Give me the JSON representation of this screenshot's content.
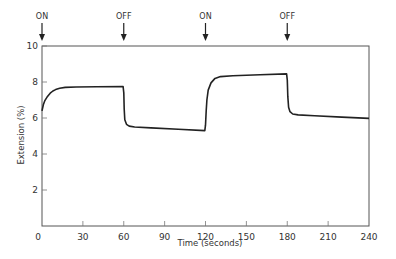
{
  "chart_data": {
    "type": "line",
    "title": "",
    "xlabel": "Time  (seconds)",
    "ylabel": "Extension  (%)",
    "xlim": [
      0,
      240
    ],
    "ylim": [
      0,
      10
    ],
    "x_ticks": [
      0,
      30,
      60,
      90,
      120,
      150,
      180,
      210,
      240
    ],
    "y_ticks": [
      2,
      4,
      6,
      8,
      10
    ],
    "y_tick_labels_shown": [
      "0",
      "2",
      "4",
      "6",
      "8",
      "10"
    ],
    "grid": false,
    "legend": null,
    "series": [
      {
        "name": "Extension",
        "color": "#222222",
        "points": [
          [
            0,
            6.4
          ],
          [
            1,
            6.75
          ],
          [
            2,
            6.95
          ],
          [
            4,
            7.2
          ],
          [
            6,
            7.38
          ],
          [
            8,
            7.5
          ],
          [
            10,
            7.58
          ],
          [
            13,
            7.65
          ],
          [
            17,
            7.7
          ],
          [
            25,
            7.72
          ],
          [
            40,
            7.74
          ],
          [
            59.5,
            7.75
          ],
          [
            60,
            7.4
          ],
          [
            60.3,
            6.5
          ],
          [
            60.8,
            5.9
          ],
          [
            62,
            5.65
          ],
          [
            64,
            5.55
          ],
          [
            68,
            5.5
          ],
          [
            80,
            5.45
          ],
          [
            100,
            5.38
          ],
          [
            119.5,
            5.3
          ],
          [
            120,
            5.6
          ],
          [
            120.5,
            6.4
          ],
          [
            121,
            7.0
          ],
          [
            122,
            7.55
          ],
          [
            124,
            7.95
          ],
          [
            127,
            8.2
          ],
          [
            131,
            8.3
          ],
          [
            140,
            8.35
          ],
          [
            160,
            8.4
          ],
          [
            179.5,
            8.45
          ],
          [
            180,
            8.1
          ],
          [
            180.4,
            7.2
          ],
          [
            181,
            6.6
          ],
          [
            182,
            6.35
          ],
          [
            184,
            6.22
          ],
          [
            188,
            6.17
          ],
          [
            200,
            6.12
          ],
          [
            220,
            6.05
          ],
          [
            240,
            5.98
          ]
        ]
      }
    ],
    "annotations": [
      {
        "x": 0,
        "label": "ON"
      },
      {
        "x": 60,
        "label": "OFF"
      },
      {
        "x": 120,
        "label": "ON"
      },
      {
        "x": 180,
        "label": "OFF"
      }
    ]
  }
}
